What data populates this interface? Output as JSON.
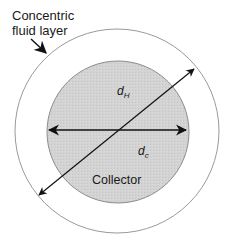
{
  "diagram": {
    "labels": {
      "fluid_layer_line1": "Concentric",
      "fluid_layer_line2": "fluid layer",
      "dH_main": "d",
      "dH_sub": "H",
      "dc_main": "d",
      "dc_sub": "c",
      "collector": "Collector"
    },
    "shapes": {
      "outer_circle": {
        "name": "concentric-fluid-layer",
        "cx": 117,
        "cy": 131,
        "r": 102,
        "stroke": "#9a9a9a",
        "fill": "#ffffff"
      },
      "inner_circle": {
        "name": "collector",
        "cx": 118,
        "cy": 132,
        "r": 71,
        "stroke": "#8c8c8c",
        "fill": "#d3d3d3"
      }
    },
    "arrows": [
      {
        "name": "collector-diameter-dc",
        "type": "double",
        "from": [
          47,
          130
        ],
        "to": [
          188,
          130
        ]
      },
      {
        "name": "hydrodynamic-diameter-dH",
        "type": "double",
        "from": [
          37,
          197
        ],
        "to": [
          196,
          67
        ]
      },
      {
        "name": "fluid-layer-pointer",
        "type": "single",
        "from": [
          32,
          40
        ],
        "to": [
          48,
          55
        ]
      }
    ],
    "colors": {
      "line": "#111111",
      "collector_fill": "#d3d3d3",
      "circle_stroke": "#9a9a9a"
    }
  }
}
